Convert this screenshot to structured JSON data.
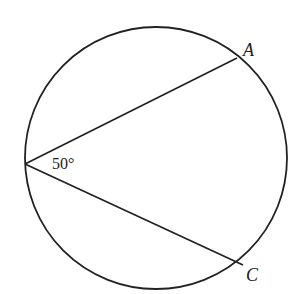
{
  "diagram": {
    "type": "inscribed-angle",
    "angle_label": "50°",
    "points": [
      {
        "name": "A",
        "label": "A"
      },
      {
        "name": "C",
        "label": "C"
      }
    ],
    "stroke_color": "#222222",
    "background": "#ffffff"
  }
}
